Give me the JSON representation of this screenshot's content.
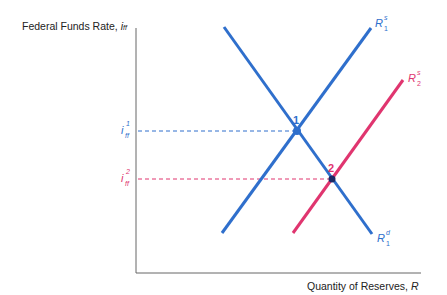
{
  "axes": {
    "y_label": "Federal Funds Rate, ",
    "y_label_var": "i",
    "y_label_sub": "ff",
    "x_label": "Quantity of Reserves, ",
    "x_label_var": "R"
  },
  "colors": {
    "blue": "#2f6fcc",
    "pink": "#e0356f",
    "axis": "#555555"
  },
  "curves": [
    {
      "name": "R",
      "sup": "d",
      "sub": "1",
      "color": "blue",
      "role": "demand"
    },
    {
      "name": "R",
      "sup": "s",
      "sub": "1",
      "color": "blue",
      "role": "supply-initial"
    },
    {
      "name": "R",
      "sup": "s",
      "sub": "2",
      "color": "pink",
      "role": "supply-new"
    }
  ],
  "rates": [
    {
      "var": "i",
      "sub": "ff",
      "sup": "1",
      "color": "blue"
    },
    {
      "var": "i",
      "sub": "ff",
      "sup": "2",
      "color": "pink"
    }
  ],
  "points": [
    {
      "label": "1",
      "color": "blue"
    },
    {
      "label": "2",
      "color": "pink"
    }
  ]
}
